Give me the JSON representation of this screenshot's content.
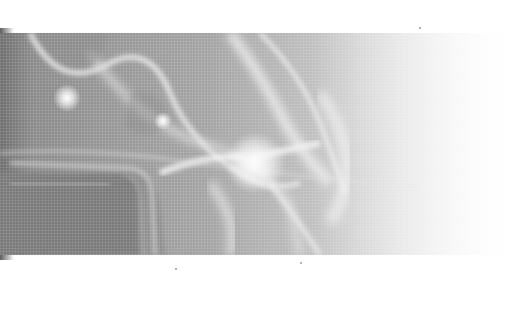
{
  "image": {
    "description": "Grayscale halftone photograph of a translucent, ghostly smoke-like figure over a dark vehicle shape, with bright light flares; the band fades to white on the right.",
    "colors": {
      "background": "#ffffff",
      "dark_tone": "#6e6e6e",
      "mid_tone": "#a4a4a4",
      "light_tone": "#e8e8e8",
      "highlight": "#ffffff"
    },
    "photo_band": {
      "top": 33,
      "height": 222
    }
  }
}
